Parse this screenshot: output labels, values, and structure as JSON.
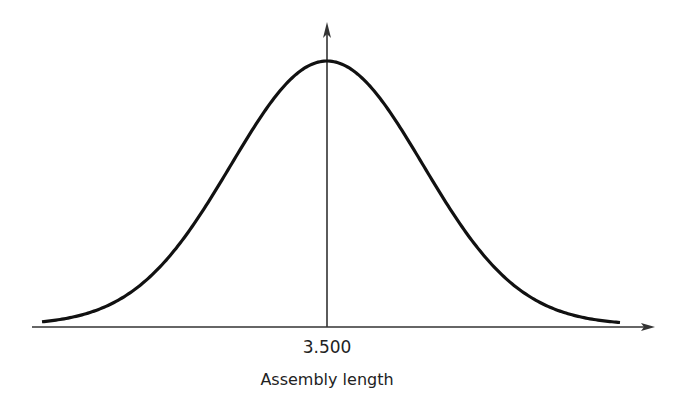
{
  "chart_data": {
    "type": "line",
    "title": "",
    "subtitle": "",
    "xlabel": "Assembly length",
    "ylabel": "",
    "x_ticks": [
      "3.500"
    ],
    "distribution": "normal",
    "mean": 3.5,
    "grid": false,
    "legend": null,
    "series": [
      {
        "name": "density",
        "shape": "normal-curve",
        "center": 3.5
      }
    ],
    "colors": {
      "curve": "#111111",
      "axes": "#333333",
      "background": "#ffffff"
    },
    "geometry": {
      "axis_y_px": 327,
      "axis_x_start_px": 32,
      "axis_x_end_px": 655,
      "center_x_px": 327,
      "peak_y_px": 61,
      "vertical_axis_top_px": 22,
      "curve_left_px": 42,
      "curve_right_px": 620,
      "sigma_px": 96
    }
  },
  "labels": {
    "tick_center": "3.500",
    "x_axis": "Assembly length"
  }
}
